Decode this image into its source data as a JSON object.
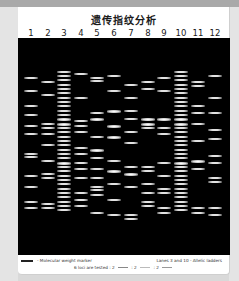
{
  "title": "遗传指纹分析",
  "lanes": [
    {
      "label": "1",
      "x": 9,
      "bands": [
        [
          18,
          0
        ],
        [
          24,
          0
        ],
        [
          31,
          0
        ],
        [
          35,
          0
        ],
        [
          40,
          0
        ],
        [
          44,
          0
        ],
        [
          53,
          0
        ],
        [
          54.5,
          0
        ],
        [
          63,
          0
        ],
        [
          68,
          0
        ],
        [
          75,
          0
        ],
        [
          78,
          0
        ]
      ]
    },
    {
      "label": "2",
      "x": 26,
      "bands": [
        [
          20,
          0
        ],
        [
          26,
          0
        ],
        [
          39,
          0
        ],
        [
          41,
          0
        ],
        [
          44,
          0
        ],
        [
          49,
          0
        ],
        [
          56,
          0
        ],
        [
          62,
          0
        ],
        [
          64,
          0
        ],
        [
          76,
          0
        ],
        [
          78,
          0
        ]
      ]
    },
    {
      "label": "3",
      "x": 42,
      "bands": [
        [
          15,
          0
        ],
        [
          17,
          0
        ],
        [
          19,
          0
        ],
        [
          21,
          0
        ],
        [
          23,
          0
        ],
        [
          25,
          0
        ],
        [
          27,
          0
        ],
        [
          29,
          0
        ],
        [
          31,
          0
        ],
        [
          33,
          0
        ],
        [
          35,
          0
        ],
        [
          37,
          1
        ],
        [
          39,
          1
        ],
        [
          41,
          0
        ],
        [
          43,
          0
        ],
        [
          45,
          0
        ],
        [
          47,
          0
        ],
        [
          49,
          0
        ],
        [
          51,
          0
        ],
        [
          53,
          0
        ],
        [
          55,
          0
        ],
        [
          57,
          1
        ],
        [
          59,
          0
        ],
        [
          61,
          0
        ],
        [
          63,
          0
        ],
        [
          65,
          0
        ],
        [
          67,
          0
        ],
        [
          69,
          0
        ],
        [
          71,
          0
        ],
        [
          73,
          0
        ],
        [
          75,
          0
        ],
        [
          77,
          0
        ],
        [
          79,
          0
        ]
      ]
    },
    {
      "label": "4",
      "x": 59,
      "bands": [
        [
          16,
          0
        ],
        [
          27,
          0
        ],
        [
          38,
          0
        ],
        [
          40,
          0
        ],
        [
          43,
          0
        ],
        [
          50,
          0
        ],
        [
          53,
          0
        ],
        [
          57,
          0
        ],
        [
          60,
          0
        ],
        [
          64,
          0
        ],
        [
          71,
          0
        ],
        [
          74,
          0
        ],
        [
          77,
          0
        ]
      ]
    },
    {
      "label": "5",
      "x": 75,
      "bands": [
        [
          18,
          0
        ],
        [
          19.5,
          0
        ],
        [
          34,
          0
        ],
        [
          37,
          1
        ],
        [
          45,
          0
        ],
        [
          51,
          1
        ],
        [
          55,
          0
        ],
        [
          60,
          0
        ],
        [
          64,
          0
        ],
        [
          68,
          0
        ],
        [
          69.5,
          0
        ],
        [
          72,
          0
        ],
        [
          80,
          0
        ]
      ]
    },
    {
      "label": "6",
      "x": 92,
      "bands": [
        [
          17,
          0
        ],
        [
          24,
          0
        ],
        [
          33,
          1
        ],
        [
          40,
          1
        ],
        [
          45,
          1
        ],
        [
          56,
          0
        ],
        [
          61,
          1
        ],
        [
          67,
          0
        ],
        [
          74,
          0
        ],
        [
          81,
          0
        ]
      ]
    },
    {
      "label": "7",
      "x": 109,
      "bands": [
        [
          21,
          0
        ],
        [
          27,
          0
        ],
        [
          33,
          0
        ],
        [
          37,
          0
        ],
        [
          43,
          0
        ],
        [
          48,
          0
        ],
        [
          59,
          0
        ],
        [
          62,
          1
        ],
        [
          68,
          0
        ],
        [
          81,
          0
        ],
        [
          83,
          0
        ]
      ]
    },
    {
      "label": "8",
      "x": 126,
      "bands": [
        [
          20,
          0
        ],
        [
          23,
          0
        ],
        [
          37,
          1
        ],
        [
          39,
          1
        ],
        [
          41,
          0
        ],
        [
          59,
          0
        ],
        [
          61,
          0
        ],
        [
          67,
          0
        ],
        [
          71,
          0
        ],
        [
          75,
          0
        ],
        [
          77,
          0
        ]
      ]
    },
    {
      "label": "9",
      "x": 142,
      "bands": [
        [
          18,
          0
        ],
        [
          24,
          0
        ],
        [
          37,
          1
        ],
        [
          41,
          0
        ],
        [
          44,
          0
        ],
        [
          57,
          0
        ],
        [
          63,
          0
        ],
        [
          69,
          0
        ],
        [
          71,
          0
        ],
        [
          78,
          0
        ],
        [
          80,
          0
        ]
      ]
    },
    {
      "label": "10",
      "x": 159,
      "bands": [
        [
          15,
          0
        ],
        [
          17,
          0
        ],
        [
          19,
          0
        ],
        [
          21,
          0
        ],
        [
          23,
          0
        ],
        [
          25,
          0
        ],
        [
          27,
          0
        ],
        [
          29,
          0
        ],
        [
          31,
          0
        ],
        [
          33,
          0
        ],
        [
          35,
          0
        ],
        [
          37,
          1
        ],
        [
          39,
          1
        ],
        [
          41,
          0
        ],
        [
          43,
          0
        ],
        [
          45,
          0
        ],
        [
          47,
          0
        ],
        [
          49,
          0
        ],
        [
          51,
          0
        ],
        [
          53,
          0
        ],
        [
          55,
          0
        ],
        [
          57,
          1
        ],
        [
          59,
          0
        ],
        [
          61,
          0
        ],
        [
          63,
          0
        ],
        [
          65,
          0
        ],
        [
          67,
          0
        ],
        [
          69,
          0
        ],
        [
          71,
          0
        ],
        [
          73,
          0
        ],
        [
          75,
          0
        ],
        [
          77,
          0
        ],
        [
          79,
          0
        ]
      ]
    },
    {
      "label": "11",
      "x": 176,
      "bands": [
        [
          20,
          0
        ],
        [
          21.5,
          0
        ],
        [
          31,
          0
        ],
        [
          34,
          0
        ],
        [
          39,
          0
        ],
        [
          47,
          0
        ],
        [
          56,
          1
        ],
        [
          60,
          0
        ],
        [
          78,
          0
        ],
        [
          80,
          0
        ]
      ]
    },
    {
      "label": "12",
      "x": 193,
      "bands": [
        [
          17,
          0
        ],
        [
          27,
          0
        ],
        [
          34,
          0
        ],
        [
          42,
          0
        ],
        [
          46,
          0
        ],
        [
          54,
          0
        ],
        [
          57,
          0
        ],
        [
          64,
          0
        ],
        [
          66,
          0
        ],
        [
          78,
          0
        ],
        [
          81,
          0
        ]
      ]
    }
  ],
  "legend": {
    "marker": "- Molecular weight marker",
    "ladder": "Lanes 3 and 10 - Allelic ladders",
    "loci_prefix": "6 loci are tested : 2",
    "loci_mid1": ": 2",
    "loci_mid2": ": 2",
    "swatch_colors": [
      "#888888",
      "#bbbbbb",
      "#999999"
    ]
  },
  "colors": {
    "gel_bg": "#000000",
    "card_bg": "#ffffff",
    "frame": "#d9d9d9",
    "band": "#e6e6e6"
  }
}
